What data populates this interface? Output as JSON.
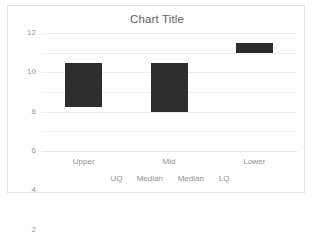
{
  "chart": {
    "title": "Chart Title",
    "frame_border_color": "#e2e2e2",
    "gridline_color": "#eceff1",
    "bar_color": "#2d2d2d",
    "label_color": "#8f8f8f",
    "title_color": "#5f5f5f"
  },
  "chart_data": {
    "type": "bar",
    "subtype": "floating-range-bar",
    "title": "Chart Title",
    "xlabel": "",
    "ylabel": "",
    "ylim": [
      0,
      12
    ],
    "ytick_step": 2,
    "yticks": [
      "12",
      "10",
      "8",
      "6",
      "4",
      "2",
      "0"
    ],
    "ytick_values": [
      12,
      10,
      8,
      6,
      4,
      2,
      0
    ],
    "grid": true,
    "legend": "none",
    "categories": [
      "Upper",
      "Mid",
      "Lower"
    ],
    "secondary_categories": [
      "UQ",
      "Median",
      "Median",
      "LQ"
    ],
    "series": [
      {
        "name": "range",
        "bars": [
          {
            "category": "Upper",
            "bottom": 4.5,
            "top": 9.0
          },
          {
            "category": "Mid",
            "bottom": 4.0,
            "top": 9.0
          },
          {
            "category": "Lower",
            "bottom": 10.0,
            "top": 11.0
          }
        ]
      }
    ],
    "values": [
      4.5,
      5.0,
      1.0
    ],
    "bases": [
      4.5,
      4.0,
      10.0
    ]
  }
}
